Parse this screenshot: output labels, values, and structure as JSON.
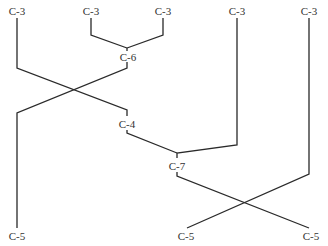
{
  "diagram": {
    "type": "tree",
    "colors": {
      "line": "#2a2a2a",
      "text": "#333333",
      "background": "#ffffff"
    },
    "nodes": [
      {
        "id": "leaf1",
        "label": "C-3"
      },
      {
        "id": "leaf2",
        "label": "C-3"
      },
      {
        "id": "leaf3",
        "label": "C-3"
      },
      {
        "id": "leaf4",
        "label": "C-3"
      },
      {
        "id": "leaf5",
        "label": "C-3"
      },
      {
        "id": "n6",
        "label": "C-6"
      },
      {
        "id": "n4",
        "label": "C-4"
      },
      {
        "id": "n7",
        "label": "C-7"
      },
      {
        "id": "root1",
        "label": "C-5"
      },
      {
        "id": "root2",
        "label": "C-5"
      },
      {
        "id": "root3",
        "label": "C-5"
      }
    ],
    "edges": [
      {
        "from": "leaf2",
        "to": "n6"
      },
      {
        "from": "leaf3",
        "to": "n6"
      },
      {
        "from": "leaf1",
        "to": "n4"
      },
      {
        "from": "n6",
        "to": "root1"
      },
      {
        "from": "n4",
        "to": "n7"
      },
      {
        "from": "leaf4",
        "to": "n7"
      },
      {
        "from": "n7",
        "to": "root3"
      },
      {
        "from": "leaf5",
        "to": "root2"
      }
    ]
  }
}
